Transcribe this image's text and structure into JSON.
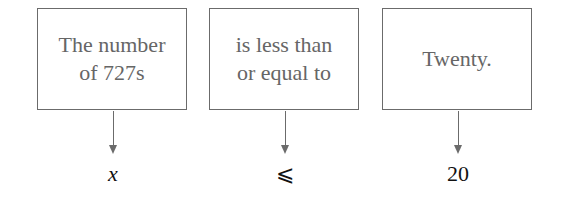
{
  "boxes": [
    {
      "lines": [
        "The number",
        "of 727s"
      ],
      "symbol": "x"
    },
    {
      "lines": [
        "is less than",
        "or equal to"
      ],
      "symbol": "⩽"
    },
    {
      "lines": [
        "Twenty."
      ],
      "symbol": "20"
    }
  ],
  "colors": {
    "border": "#6b6b6b",
    "box_text": "#666666",
    "symbol_text": "#111111"
  }
}
